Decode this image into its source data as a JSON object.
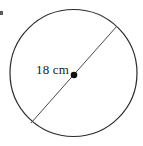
{
  "figure": {
    "name": "circle-with-diameter",
    "type": "geometry-diagram",
    "background_color": "#ffffff",
    "stroke_color": "#2b2b2b",
    "label_color": "#1a1a1a"
  },
  "circle": {
    "name": "circle-outline",
    "center_x": 73.5,
    "center_y": 73,
    "radius": 64,
    "stroke_width": 1.2
  },
  "center_point": {
    "name": "center-dot",
    "x": 74,
    "y": 75,
    "radius": 3.2
  },
  "diameter_line": {
    "name": "diameter-segment",
    "x1": 31,
    "y1": 123,
    "x2": 117,
    "y2": 26,
    "stroke_width": 1
  },
  "labels": {
    "dimension": "18 cm"
  }
}
